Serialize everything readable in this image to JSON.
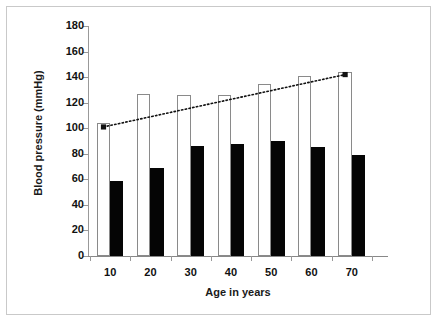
{
  "chart_data": {
    "type": "bar",
    "title": "",
    "xlabel": "Age in years",
    "ylabel": "Blood pressure (mmHg)",
    "categories": [
      "10",
      "20",
      "30",
      "40",
      "50",
      "60",
      "70"
    ],
    "xtick_labels": [
      "10",
      "20",
      "30",
      "40",
      "50",
      "60",
      "70"
    ],
    "ytick_labels": [
      "0",
      "20",
      "40",
      "60",
      "80",
      "100",
      "120",
      "140",
      "160",
      "180"
    ],
    "ytick_values": [
      0,
      20,
      40,
      60,
      80,
      100,
      120,
      140,
      160,
      180
    ],
    "ylim": [
      0,
      180
    ],
    "grid": false,
    "legend": "none",
    "series": [
      {
        "name": "Systolic blood pressure",
        "style": "open-bar",
        "color": "#ffffff",
        "edge_color": "#8a8a8a",
        "values": [
          104,
          127,
          126,
          126,
          135,
          141,
          144
        ]
      },
      {
        "name": "Diastolic blood pressure",
        "style": "solid-bar",
        "color": "#050505",
        "values": [
          59,
          69,
          86,
          88,
          90,
          85,
          79
        ]
      },
      {
        "name": "Trend line",
        "style": "dotted-line-with-square-markers",
        "color": "#111111",
        "x": [
          10,
          70
        ],
        "values": [
          101,
          142
        ]
      }
    ]
  },
  "axes": {
    "y_title": "Blood pressure (mmHg)",
    "x_title": "Age in years"
  }
}
